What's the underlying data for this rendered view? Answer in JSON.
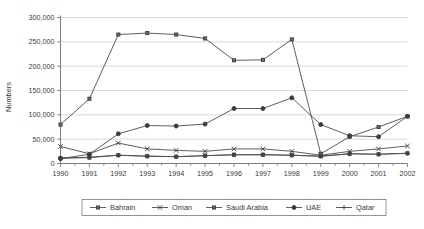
{
  "chart_data": {
    "type": "line",
    "title": "",
    "xlabel": "",
    "ylabel": "Numbers",
    "x": [
      1990,
      1991,
      1992,
      1993,
      1994,
      1995,
      1996,
      1997,
      1998,
      1999,
      2000,
      2001,
      2002
    ],
    "categories": [
      "1990",
      "1991",
      "1992",
      "1993",
      "1994",
      "1995",
      "1996",
      "1997",
      "1998",
      "1999",
      "2000",
      "2001",
      "2002"
    ],
    "ylim": [
      0,
      300000
    ],
    "ytick_labels": [
      "0",
      "50,000",
      "100,000",
      "150,000",
      "200,000",
      "250,000",
      "300,000"
    ],
    "ytick_values": [
      0,
      50000,
      100000,
      150000,
      200000,
      250000,
      300000
    ],
    "grid": "horizontal",
    "legend_position": "bottom",
    "series": [
      {
        "name": "Bahrain",
        "marker": "square",
        "values": [
          11000,
          12000,
          17000,
          15000,
          14000,
          16000,
          18000,
          18000,
          17000,
          15000,
          20000,
          19000,
          21000
        ]
      },
      {
        "name": "Oman",
        "marker": "x",
        "values": [
          35000,
          20000,
          42000,
          30000,
          27000,
          25000,
          30000,
          30000,
          25000,
          17000,
          25000,
          30000,
          36000
        ]
      },
      {
        "name": "Saudi Arabia",
        "marker": "square",
        "values": [
          80000,
          133000,
          265000,
          268000,
          265000,
          257000,
          212000,
          213000,
          255000,
          20000,
          55000,
          75000,
          97000
        ]
      },
      {
        "name": "UAE",
        "marker": "circle",
        "values": [
          10000,
          19000,
          61000,
          78000,
          77000,
          81000,
          113000,
          113000,
          135000,
          80000,
          57000,
          55000,
          97000
        ]
      },
      {
        "name": "Qatar",
        "marker": "plus",
        "values": [
          11000,
          13000,
          17000,
          15000,
          14000,
          16000,
          18000,
          18000,
          17000,
          15000,
          20000,
          19000,
          21000
        ]
      }
    ]
  },
  "legend": {
    "items": [
      {
        "label": "Bahrain"
      },
      {
        "label": "Oman"
      },
      {
        "label": "Saudi Arabia"
      },
      {
        "label": "UAE"
      },
      {
        "label": "Qatar"
      }
    ]
  }
}
